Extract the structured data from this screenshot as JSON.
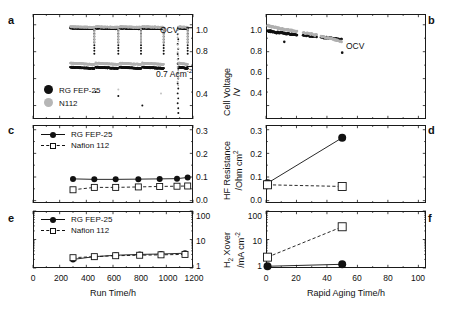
{
  "figure": {
    "panels": [
      "a",
      "b",
      "c",
      "d",
      "e",
      "f"
    ]
  },
  "axis_titles": {
    "cell_voltage": "Cell Voltage",
    "cell_voltage_unit": "/V",
    "hf_resistance": "HF Resistance",
    "hf_resistance_unit": "/Ohm cm",
    "hf_resistance_unit_sup": "2",
    "h2_xover": "H",
    "h2_xover_sub": "2",
    "h2_xover_rest": " Xover",
    "h2_xover_unit": "/mA cm",
    "h2_xover_unit_sup": "-2",
    "run_time": "Run Time/h",
    "rapid_aging_time": "Rapid Aging Time/h"
  },
  "legend_entries": {
    "rg_fep": "RG FEP-25",
    "nafion_112": "Nafion 112",
    "n112": "N112"
  },
  "annotations": {
    "ocv": "OCV",
    "current_density": "0.7 Acm",
    "current_density_sup": "-2"
  },
  "colors": {
    "rg_fep": "#111111",
    "nafion": "#b0b0b0",
    "axis": "#1a1a1a",
    "background": "#ffffff"
  },
  "chart_data": [
    {
      "id": "panel-a",
      "type": "scatter",
      "panel": "a",
      "title": "",
      "xlabel": "Run Time/h",
      "ylabel": "Cell Voltage /V",
      "xlim": [
        0,
        1200
      ],
      "ylim": [
        0.3,
        1.08
      ],
      "yticks": [
        0.4,
        0.6,
        0.8,
        1.0
      ],
      "ytick_labels": [
        "0.4",
        "0.6",
        "0.8",
        "1.0"
      ],
      "ytick_labels_shown": [
        "0.4",
        "0.8",
        "1.0"
      ],
      "xticks": [
        0,
        200,
        400,
        600,
        800,
        1000,
        1200
      ],
      "xtick_labels_shown": false,
      "grid": false,
      "legend_position": "lower-left",
      "annotations": [
        {
          "text": "OCV",
          "x": 1230,
          "y": 0.985
        },
        {
          "text": "0.7 Acm-2",
          "x": 1230,
          "y": 0.7
        }
      ],
      "series": [
        {
          "name": "RG FEP-25",
          "color": "#111111",
          "marker": "filled-circle",
          "band": "OCV",
          "x_ranges": [
            [
              280,
              460
            ],
            [
              470,
              640
            ],
            [
              650,
              810
            ],
            [
              820,
              980
            ],
            [
              1090,
              1160
            ]
          ],
          "y_level": 0.975
        },
        {
          "name": "N112",
          "color": "#b0b0b0",
          "marker": "filled-circle",
          "band": "OCV",
          "x_ranges": [
            [
              280,
              460
            ],
            [
              470,
              640
            ],
            [
              650,
              810
            ],
            [
              820,
              980
            ],
            [
              1090,
              1160
            ]
          ],
          "y_level": 0.985
        },
        {
          "name": "RG FEP-25",
          "color": "#111111",
          "marker": "filled-circle",
          "band": "0.7 Acm-2",
          "x_ranges": [
            [
              280,
              460
            ],
            [
              470,
              640
            ],
            [
              650,
              810
            ],
            [
              820,
              980
            ],
            [
              1090,
              1160
            ]
          ],
          "y_level": 0.685
        },
        {
          "name": "N112",
          "color": "#b0b0b0",
          "marker": "filled-circle",
          "band": "0.7 Acm-2",
          "x_ranges": [
            [
              280,
              460
            ],
            [
              470,
              640
            ],
            [
              650,
              810
            ],
            [
              820,
              980
            ],
            [
              1090,
              1160
            ]
          ],
          "y_level": 0.715
        }
      ]
    },
    {
      "id": "panel-b",
      "type": "scatter",
      "panel": "b",
      "xlabel": "Rapid Aging Time/h",
      "ylabel": "Cell Voltage /V",
      "xlim": [
        0,
        105
      ],
      "ylim": [
        0.3,
        1.08
      ],
      "yticks": [
        0.4,
        0.6,
        0.8,
        1.0
      ],
      "ytick_labels": [
        "0.4",
        "0.6",
        "0.8",
        "1.0"
      ],
      "xticks": [
        0,
        20,
        40,
        60,
        80,
        100
      ],
      "xtick_labels_shown": false,
      "grid": false,
      "annotations": [
        {
          "text": "OCV",
          "x": 57,
          "y": 0.875
        }
      ],
      "series": [
        {
          "name": "RG FEP-25",
          "color": "#111111",
          "marker": "filled-circle",
          "x": [
            1,
            4,
            8,
            12,
            16,
            20,
            25,
            30,
            35,
            40,
            45,
            50
          ],
          "y": [
            0.955,
            0.948,
            0.942,
            0.937,
            0.932,
            0.928,
            0.922,
            0.916,
            0.91,
            0.903,
            0.896,
            0.888
          ]
        },
        {
          "name": "N112",
          "color": "#b0b0b0",
          "marker": "filled-circle",
          "x": [
            1,
            4,
            8,
            12,
            16,
            20,
            25,
            30,
            35,
            40,
            45,
            50
          ],
          "y": [
            0.995,
            0.985,
            0.975,
            0.965,
            0.958,
            0.95,
            0.94,
            0.93,
            0.918,
            0.905,
            0.89,
            0.872
          ]
        }
      ]
    },
    {
      "id": "panel-c",
      "type": "line",
      "panel": "c",
      "xlabel": "Run Time/h",
      "ylabel": "HF Resistance /Ohm cm2",
      "xlim": [
        0,
        1200
      ],
      "ylim": [
        -0.01,
        0.32
      ],
      "yticks": [
        0.0,
        0.1,
        0.2,
        0.3
      ],
      "ytick_labels": [
        "0.0",
        "0.1",
        "0.2",
        "0.3"
      ],
      "xticks": [
        0,
        200,
        400,
        600,
        800,
        1000,
        1200
      ],
      "xtick_labels_shown": false,
      "grid": false,
      "legend_position": "upper-left",
      "series": [
        {
          "name": "RG FEP-25",
          "color": "#111111",
          "marker": "filled-circle",
          "line": "solid",
          "x": [
            300,
            460,
            620,
            790,
            950,
            1080,
            1160
          ],
          "y": [
            0.092,
            0.09,
            0.09,
            0.091,
            0.092,
            0.093,
            0.098
          ]
        },
        {
          "name": "Nafion 112",
          "color": "#111111",
          "marker": "open-square",
          "line": "dashed",
          "x": [
            300,
            460,
            620,
            790,
            950,
            1080,
            1160
          ],
          "y": [
            0.046,
            0.056,
            0.056,
            0.058,
            0.06,
            0.061,
            0.062
          ]
        }
      ]
    },
    {
      "id": "panel-d",
      "type": "line",
      "panel": "d",
      "xlabel": "Rapid Aging Time/h",
      "ylabel": "HF Resistance /Ohm cm2",
      "xlim": [
        0,
        105
      ],
      "ylim": [
        -0.01,
        0.32
      ],
      "yticks": [
        0.0,
        0.1,
        0.2,
        0.3
      ],
      "ytick_labels": [
        "0.0",
        "0.1",
        "0.2",
        "0.3"
      ],
      "xticks": [
        0,
        20,
        40,
        60,
        80,
        100
      ],
      "xtick_labels_shown": false,
      "grid": false,
      "series": [
        {
          "name": "RG FEP-25",
          "color": "#111111",
          "marker": "filled-circle",
          "line": "solid",
          "x": [
            1,
            50
          ],
          "y": [
            0.074,
            0.266
          ]
        },
        {
          "name": "Nafion 112",
          "color": "#111111",
          "marker": "open-square",
          "line": "dashed",
          "x": [
            1,
            50
          ],
          "y": [
            0.067,
            0.06
          ]
        }
      ]
    },
    {
      "id": "panel-e",
      "type": "line",
      "panel": "e",
      "xlabel": "Run Time/h",
      "ylabel": "H2 Xover /mA cm-2",
      "xlim": [
        0,
        1200
      ],
      "ylim": [
        1,
        100
      ],
      "yscale": "log",
      "yticks": [
        1,
        10,
        100
      ],
      "ytick_labels": [
        "1",
        "10",
        "100"
      ],
      "xticks": [
        0,
        200,
        400,
        600,
        800,
        1000,
        1200
      ],
      "xtick_labels": [
        "0",
        "200",
        "400",
        "600",
        "800",
        "1000",
        "1200"
      ],
      "grid": false,
      "legend_position": "upper-left",
      "series": [
        {
          "name": "RG FEP-25",
          "color": "#111111",
          "marker": "filled-circle",
          "line": "solid",
          "x": [
            300,
            460,
            620,
            800,
            960,
            1140
          ],
          "y": [
            2.0,
            2.5,
            2.8,
            3.0,
            3.1,
            3.3
          ]
        },
        {
          "name": "Nafion 112",
          "color": "#111111",
          "marker": "open-square",
          "line": "dashed",
          "x": [
            300,
            460,
            620,
            800,
            960,
            1140
          ],
          "y": [
            2.3,
            2.5,
            2.7,
            2.8,
            2.9,
            3.0
          ]
        }
      ]
    },
    {
      "id": "panel-f",
      "type": "line",
      "panel": "f",
      "xlabel": "Rapid Aging Time/h",
      "ylabel": "H2 Xover /mA cm-2",
      "xlim": [
        0,
        105
      ],
      "ylim": [
        1,
        100
      ],
      "yscale": "log",
      "yticks": [
        1,
        10,
        100
      ],
      "ytick_labels": [
        "1",
        "10",
        "100"
      ],
      "xticks": [
        0,
        20,
        40,
        60,
        80,
        100
      ],
      "xtick_labels": [
        "0",
        "20",
        "40",
        "60",
        "80",
        "100"
      ],
      "grid": false,
      "series": [
        {
          "name": "RG FEP-25",
          "color": "#111111",
          "marker": "filled-circle",
          "line": "solid",
          "x": [
            1,
            50
          ],
          "y": [
            1.15,
            1.35
          ]
        },
        {
          "name": "Nafion 112",
          "color": "#111111",
          "marker": "open-square",
          "line": "dashed",
          "x": [
            1,
            50
          ],
          "y": [
            2.4,
            28.0
          ]
        }
      ]
    }
  ]
}
